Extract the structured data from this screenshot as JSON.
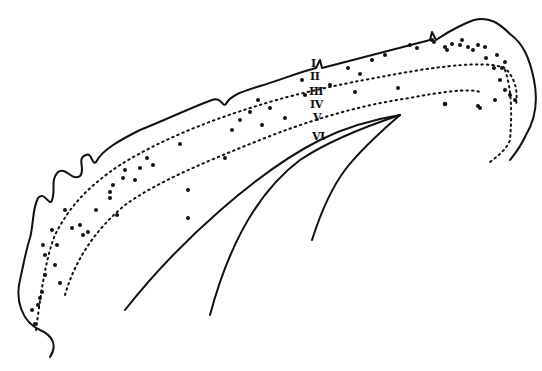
{
  "diagram": {
    "layer_labels": [
      "I",
      "II",
      "III",
      "IV",
      "V",
      "VI"
    ],
    "colors": {
      "ink": "#111111",
      "background": "#ffffff"
    }
  }
}
